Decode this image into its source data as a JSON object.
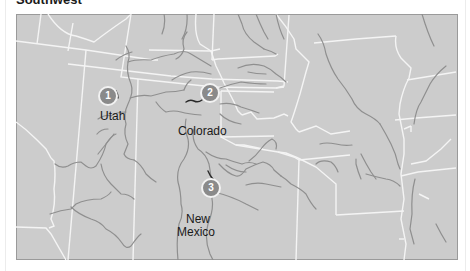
{
  "header": {
    "title": "Southwest"
  },
  "map": {
    "colors": {
      "land": "#cccccc",
      "frame": "#9a9a9a",
      "state_border": "#f4f4f4",
      "river": "#8f8f8f",
      "highlight_river": "#2a2a2a",
      "marker_fill": "#8a8a8a",
      "marker_text": "#ffffff",
      "label_text": "#1a1a1a"
    },
    "state_labels": [
      {
        "name": "Utah"
      },
      {
        "name": "Colorado"
      },
      {
        "name": "New"
      },
      {
        "name": "Mexico"
      }
    ],
    "markers": [
      {
        "number": "1",
        "state": "Utah"
      },
      {
        "number": "2",
        "state": "Colorado"
      },
      {
        "number": "3",
        "state": "New Mexico"
      }
    ]
  }
}
